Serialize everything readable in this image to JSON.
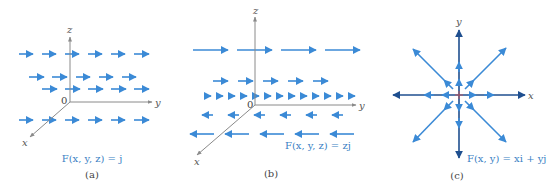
{
  "figure": {
    "colors": {
      "vector": "#3b8ad6",
      "axis": "#8a8a8a",
      "axis_dark": "#1f4f8f",
      "caption": "#3b7fc4",
      "origin_mark": "#d05050"
    },
    "panels": [
      {
        "id": "a",
        "label": "(a)",
        "caption": "F(x, y, z) = j",
        "axes": {
          "z": "z",
          "y": "y",
          "x": "x",
          "origin": "0"
        },
        "description": "Constant field: all arrows equal length pointing in +y direction"
      },
      {
        "id": "b",
        "label": "(b)",
        "caption": "F(x, y, z) = zj",
        "axes": {
          "z": "z",
          "y": "y",
          "x": "x",
          "origin": "0"
        },
        "description": "Arrows point +y above the xy-plane and -y below, length proportional to z"
      },
      {
        "id": "c",
        "label": "(c)",
        "caption": "F(x, y) = xi + yj",
        "axes": {
          "y": "y",
          "x": "x"
        },
        "description": "Radial field pointing away from origin along 8 directions"
      }
    ]
  }
}
